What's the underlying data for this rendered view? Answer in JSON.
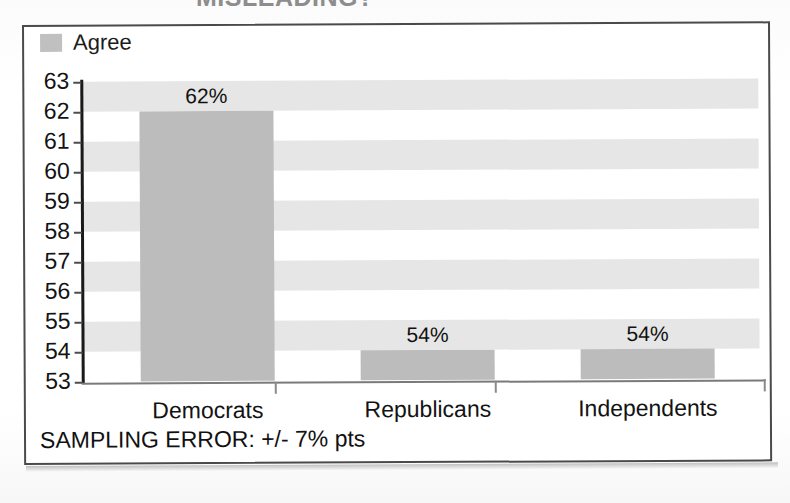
{
  "headline": {
    "text": "MISLEADING?"
  },
  "legend": {
    "position": "top-left",
    "entries": [
      {
        "label": "Agree",
        "color": "#c0c0c0",
        "icon": "legend-swatch"
      }
    ]
  },
  "footer": {
    "note": "SAMPLING ERROR: +/- 7% pts"
  },
  "colors": {
    "bar_fill": "#bcbcbc",
    "band_fill": "#e6e6e6",
    "frame_border": "#4a4a4a",
    "axis_line": "#1a1a1a",
    "text": "#111111"
  },
  "chart_data": {
    "type": "bar",
    "title": "",
    "subtitle": "",
    "xlabel": "",
    "ylabel": "",
    "categories": [
      "Democrats",
      "Republicans",
      "Independents"
    ],
    "values": [
      62,
      54,
      54
    ],
    "value_labels": [
      "62%",
      "54%",
      "54%"
    ],
    "series": [
      {
        "name": "Agree",
        "values": [
          62,
          54,
          54
        ],
        "color": "#bcbcbc"
      }
    ],
    "ylim": [
      53,
      63
    ],
    "ytick_labels": [
      "63",
      "62",
      "61",
      "60",
      "59",
      "58",
      "57",
      "56",
      "55",
      "54",
      "53"
    ],
    "ytick_values": [
      63,
      62,
      61,
      60,
      59,
      58,
      57,
      56,
      55,
      54,
      53
    ],
    "ytick_order": "descending",
    "grid": false,
    "banded_background": true,
    "band_step": 2,
    "legend_position": "top-left",
    "annotations": [
      "SAMPLING ERROR: +/- 7% pts"
    ],
    "note": "Y axis truncated at 53 rather than 0, exaggerating differences"
  }
}
